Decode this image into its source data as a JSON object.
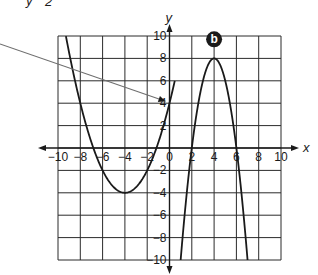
{
  "header_fragment": {
    "left": "y",
    "right": "2"
  },
  "marker": {
    "label": "b",
    "x": 4,
    "y": 9.7
  },
  "colors": {
    "ink": "#1a1a1a",
    "grid": "#2b2b2b",
    "pointer": "#6e6e6e",
    "background": "#ffffff"
  },
  "chart_data": {
    "type": "line",
    "title": "",
    "xlabel": "x",
    "ylabel": "y",
    "xlim": [
      -10,
      10
    ],
    "ylim": [
      -10,
      10
    ],
    "grid": true,
    "grid_step": 2,
    "x_ticks": [
      -10,
      -8,
      -6,
      -4,
      -2,
      0,
      2,
      4,
      6,
      8,
      10
    ],
    "y_ticks": [
      -10,
      -8,
      -6,
      -4,
      -2,
      2,
      4,
      6,
      8,
      10
    ],
    "x_tick_labels": [
      "−10",
      "−8",
      "−6",
      "−4",
      "−2",
      "0",
      "2",
      "4",
      "6",
      "8",
      "10"
    ],
    "y_tick_labels": [
      "−10",
      "−8",
      "−6",
      "−4",
      "−2",
      "2",
      "4",
      "6",
      "8",
      "10"
    ],
    "series": [
      {
        "name": "left parabola",
        "equation": "y = 0.5(x + 4)^2 - 4",
        "vertex": [
          -4,
          -4
        ],
        "roots": [
          -6.83,
          -1.17
        ],
        "y_intercept": 4,
        "x": [
          -9.29,
          -8,
          -6.83,
          -6,
          -4,
          -2,
          -1.17,
          0,
          0.47
        ],
        "y": [
          10,
          4,
          0,
          -2,
          -4,
          -2,
          0,
          4,
          10
        ]
      },
      {
        "name": "right parabola",
        "equation": "y = -2(x - 4)^2 + 8",
        "vertex": [
          4,
          8
        ],
        "roots": [
          2,
          6
        ],
        "x": [
          1,
          2,
          3,
          4,
          5,
          6,
          7
        ],
        "y": [
          -10,
          0,
          6,
          8,
          6,
          0,
          -10
        ]
      }
    ],
    "annotations": [
      {
        "type": "pointer-arrow",
        "target": [
          0,
          4
        ],
        "from": "left edge of image"
      },
      {
        "type": "label",
        "text": "b",
        "at": [
          4,
          9.7
        ]
      }
    ]
  }
}
